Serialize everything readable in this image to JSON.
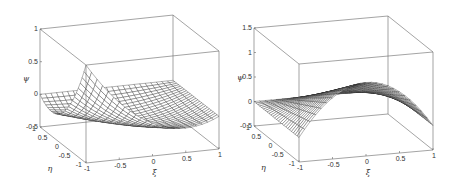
{
  "chart_data": [
    {
      "type": "surface",
      "title": "",
      "xlabel": "ξ",
      "ylabel": "η",
      "zlabel": "ψ",
      "xlim": [
        -1,
        1
      ],
      "ylim": [
        -1,
        1
      ],
      "zlim": [
        -0.5,
        1
      ],
      "x_ticks": [
        "-1",
        "-0.5",
        "0",
        "0.5",
        "1"
      ],
      "y_ticks": [
        "-1",
        "-0.5",
        "0",
        "0.5",
        "1"
      ],
      "z_ticks": [
        "-0.5",
        "0",
        "0.5",
        "1"
      ],
      "grid": false,
      "mesh": "wireframe",
      "description": "Shape function with peak value 1 at corner (ξ=-1, η=-1), zero along other nodes, dipping to about -0.35 in the interior",
      "notable_points": [
        {
          "xi": -1,
          "eta": -1,
          "psi": 1
        },
        {
          "xi": -1,
          "eta": 1,
          "psi": 0
        },
        {
          "xi": 1,
          "eta": 1,
          "psi": 0
        },
        {
          "xi": 1,
          "eta": -1,
          "psi": 0
        }
      ],
      "style": {
        "line_color": "#222222",
        "face_color": "#ffffff",
        "box_color": "#666666"
      },
      "projection": {
        "origin": [
          86,
          163
        ],
        "xi_vec": [
          133,
          -14
        ],
        "eta_vec": [
          -46,
          -36
        ],
        "psi_scale": 65.3,
        "psi_min": -0.5
      }
    },
    {
      "type": "surface",
      "title": "",
      "xlabel": "ξ",
      "ylabel": "η",
      "zlabel": "ψ",
      "xlim": [
        -1,
        1
      ],
      "ylim": [
        -1,
        1
      ],
      "zlim": [
        -0.5,
        1.5
      ],
      "x_ticks": [
        "-1",
        "-0.5",
        "0",
        "0.5",
        "1"
      ],
      "y_ticks": [
        "-1",
        "-0.5",
        "0",
        "0.5",
        "1"
      ],
      "z_ticks": [
        "-0.5",
        "0",
        "0.5",
        "1",
        "1.5"
      ],
      "grid": false,
      "mesh": "wireframe",
      "description": "Mid-side shape function peaking at 1 at (ξ=0, η=-1), zero at corners, sloping toward η=1",
      "notable_points": [
        {
          "xi": 0,
          "eta": -1,
          "psi": 1
        },
        {
          "xi": -1,
          "eta": -1,
          "psi": 0
        },
        {
          "xi": 1,
          "eta": -1,
          "psi": 0
        }
      ],
      "style": {
        "line_color": "#222222",
        "face_color": "#ffffff",
        "box_color": "#666666"
      },
      "projection": {
        "origin": [
          299,
          162
        ],
        "xi_vec": [
          134,
          -12
        ],
        "eta_vec": [
          -45,
          -36
        ],
        "psi_scale": 49,
        "psi_min": -0.5
      }
    }
  ]
}
